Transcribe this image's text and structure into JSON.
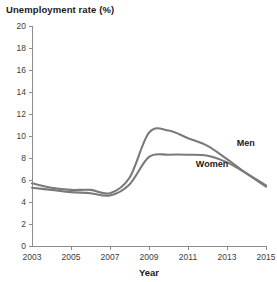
{
  "chart_data": {
    "type": "line",
    "title": "Unemployment rate (%)",
    "xlabel": "Year",
    "ylabel": "",
    "xlim": [
      2003,
      2015
    ],
    "ylim": [
      0,
      20
    ],
    "grid": false,
    "legend_position": "inline-annotation",
    "x_ticks": [
      "2003",
      "2005",
      "2007",
      "2009",
      "2011",
      "2013",
      "2015"
    ],
    "x_tick_values": [
      2003,
      2005,
      2007,
      2009,
      2011,
      2013,
      2015
    ],
    "y_ticks": [
      "0",
      "2",
      "4",
      "6",
      "8",
      "10",
      "12",
      "14",
      "16",
      "18",
      "20"
    ],
    "y_tick_values": [
      0,
      2,
      4,
      6,
      8,
      10,
      12,
      14,
      16,
      18,
      20
    ],
    "x": [
      2003,
      2004,
      2005,
      2006,
      2007,
      2008,
      2009,
      2010,
      2011,
      2012,
      2013,
      2014,
      2015
    ],
    "series": [
      {
        "name": "Men",
        "color": "#7a7a7a",
        "values": [
          5.7,
          5.3,
          5.1,
          5.1,
          4.8,
          6.2,
          10.3,
          10.5,
          9.8,
          9.1,
          7.9,
          6.6,
          5.4
        ],
        "annotation": "Men",
        "annotation_x": 2013.5,
        "annotation_y": 9.1
      },
      {
        "name": "Women",
        "color": "#7a7a7a",
        "values": [
          5.3,
          5.1,
          4.9,
          4.8,
          4.6,
          5.6,
          8.1,
          8.3,
          8.3,
          8.2,
          7.6,
          6.6,
          5.5
        ],
        "annotation": "Women",
        "annotation_x": 2011.4,
        "annotation_y": 7.2
      }
    ]
  }
}
